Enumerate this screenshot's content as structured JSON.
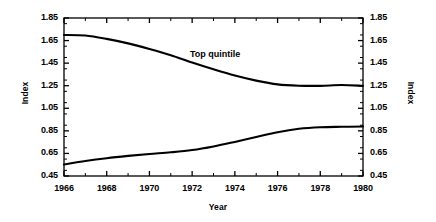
{
  "chart_data": {
    "type": "line",
    "title": "",
    "xlabel": "Year",
    "ylabel": "Index",
    "ylabel_right": "Index",
    "xlim": [
      1966,
      1980
    ],
    "ylim": [
      0.45,
      1.85
    ],
    "grid": false,
    "legend": "none",
    "xticks": [
      "1966",
      "1968",
      "1970",
      "1972",
      "1974",
      "1976",
      "1978",
      "1980"
    ],
    "xtick_values": [
      1966,
      1968,
      1970,
      1972,
      1974,
      1976,
      1978,
      1980
    ],
    "xminor_values": [
      1967,
      1969,
      1971,
      1973,
      1975,
      1977,
      1979
    ],
    "yticks": [
      "1.85",
      "1.65",
      "1.45",
      "1.25",
      "1.05",
      "0.85",
      "0.65",
      "0.45"
    ],
    "ytick_values": [
      1.85,
      1.65,
      1.45,
      1.25,
      1.05,
      0.85,
      0.65,
      0.45
    ],
    "yticks_right": [
      "1.85",
      "1.65",
      "1.45",
      "1.25",
      "1.05",
      "0.85",
      "0.65",
      "0.45"
    ],
    "annotations": [
      {
        "text": "Top quintile",
        "x": 1973.3,
        "y": 1.52
      }
    ],
    "x": [
      1966,
      1967,
      1968,
      1969,
      1970,
      1971,
      1972,
      1973,
      1974,
      1975,
      1976,
      1977,
      1978,
      1979,
      1980
    ],
    "series": [
      {
        "name": "Top quintile",
        "values": [
          1.7,
          1.695,
          1.665,
          1.625,
          1.575,
          1.52,
          1.455,
          1.395,
          1.34,
          1.295,
          1.262,
          1.25,
          1.249,
          1.256,
          1.249
        ]
      },
      {
        "name": "Bottom quintile",
        "values": [
          0.552,
          0.583,
          0.608,
          0.628,
          0.645,
          0.66,
          0.68,
          0.712,
          0.752,
          0.795,
          0.838,
          0.868,
          0.882,
          0.886,
          0.888
        ]
      }
    ]
  },
  "axes": {
    "left_title": "Index",
    "right_title": "Index",
    "x_title": "Year"
  },
  "style": {
    "line_color": "#000000",
    "frame_color": "#000000",
    "background": "#ffffff"
  }
}
